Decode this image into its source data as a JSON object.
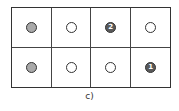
{
  "diagram": {
    "label": "c)",
    "rows": 2,
    "cols": 4,
    "cells": [
      {
        "state": "filled",
        "text": ""
      },
      {
        "state": "empty",
        "text": ""
      },
      {
        "state": "dark",
        "text": "2"
      },
      {
        "state": "empty",
        "text": ""
      },
      {
        "state": "filled",
        "text": ""
      },
      {
        "state": "empty",
        "text": ""
      },
      {
        "state": "empty",
        "text": ""
      },
      {
        "state": "dark",
        "text": "1"
      }
    ]
  }
}
